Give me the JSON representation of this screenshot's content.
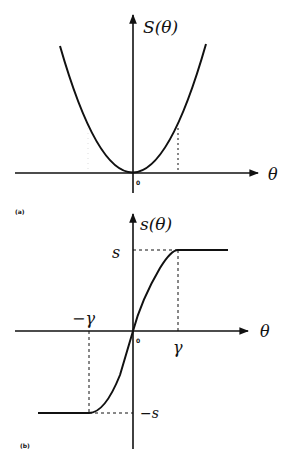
{
  "figure": {
    "panel_a": {
      "tag": "(a)",
      "y_label": "S(θ)",
      "x_label": "θ",
      "origin": "0",
      "curve": "parabola"
    },
    "panel_b": {
      "tag": "(b)",
      "y_label": "s(θ)",
      "x_label": "θ",
      "origin": "0",
      "upper_level": "s",
      "lower_level": "−s",
      "pos_threshold": "γ",
      "neg_threshold": "−γ",
      "curve": "saturating sigmoid"
    }
  },
  "colors": {
    "ink": "#111111",
    "background": "#ffffff"
  }
}
